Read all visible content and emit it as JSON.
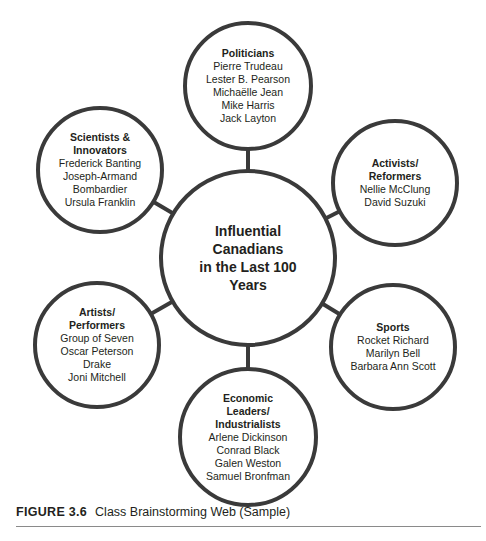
{
  "diagram": {
    "stroke_color": "#3a3a3a",
    "center": {
      "title_lines": [
        "Influential",
        "Canadians",
        "in the Last 100",
        "Years"
      ],
      "cx": 248,
      "cy": 258,
      "r": 87
    },
    "nodes": [
      {
        "id": "politicians",
        "title_lines": [
          "Politicians"
        ],
        "items": [
          "Pierre Trudeau",
          "Lester B. Pearson",
          "Michaëlle Jean",
          "Mike Harris",
          "Jack Layton"
        ],
        "cx": 248,
        "cy": 86,
        "r": 63
      },
      {
        "id": "scientists-innovators",
        "title_lines": [
          "Scientists &",
          "Innovators"
        ],
        "items": [
          "Frederick Banting",
          "Joseph-Armand",
          "Bombardier",
          "Ursula Franklin"
        ],
        "cx": 100,
        "cy": 170,
        "r": 62
      },
      {
        "id": "activists-reformers",
        "title_lines": [
          "Activists/",
          "Reformers"
        ],
        "items": [
          "Nellie McClung",
          "David Suzuki"
        ],
        "cx": 395,
        "cy": 183,
        "r": 62
      },
      {
        "id": "artists-performers",
        "title_lines": [
          "Artists/",
          "Performers"
        ],
        "items": [
          "Group of Seven",
          "Oscar Peterson",
          "Drake",
          "Joni Mitchell"
        ],
        "cx": 97,
        "cy": 345,
        "r": 62
      },
      {
        "id": "sports",
        "title_lines": [
          "Sports"
        ],
        "items": [
          "Rocket Richard",
          "Marilyn Bell",
          "Barbara Ann Scott"
        ],
        "cx": 393,
        "cy": 347,
        "r": 62
      },
      {
        "id": "economic-leaders-industrialists",
        "title_lines": [
          "Economic",
          "Leaders/",
          "Industrialists"
        ],
        "items": [
          "Arlene Dickinson",
          "Conrad Black",
          "Galen Weston",
          "Samuel Bronfman"
        ],
        "cx": 248,
        "cy": 437,
        "r": 68
      }
    ]
  },
  "caption": {
    "label": "FIGURE 3.6",
    "text": "Class Brainstorming Web (Sample)"
  }
}
